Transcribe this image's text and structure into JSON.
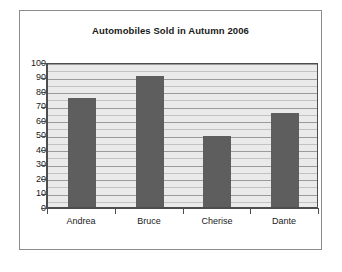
{
  "chart_data": {
    "type": "bar",
    "title": "Automobiles Sold in Autumn 2006",
    "categories": [
      "Andrea",
      "Bruce",
      "Cherise",
      "Dante"
    ],
    "values": [
      75,
      90,
      49,
      65
    ],
    "xlabel": "",
    "ylabel": "",
    "ylim": [
      0,
      100
    ],
    "ytick_step": 10,
    "yticks": [
      100,
      90,
      80,
      70,
      60,
      50,
      40,
      30,
      20,
      10,
      0
    ],
    "ytick_labels": [
      "100",
      "90",
      "80",
      "70",
      "60",
      "50",
      "40",
      "30",
      "20",
      "10",
      "0"
    ],
    "minor_gridline_step": 5,
    "grid": true,
    "legend": false,
    "legend_position": "none",
    "bar_color": "#5e5e5e",
    "plot_background": "#eaeaea",
    "gridline_color": "#9a9a9a",
    "minor_gridline_color": "#c2c2c2",
    "axis_color": "#4d4d4d",
    "frame_border_color": "#8c8c8c",
    "text_color": "#1a1a1a",
    "page_background": "#ffffff"
  }
}
